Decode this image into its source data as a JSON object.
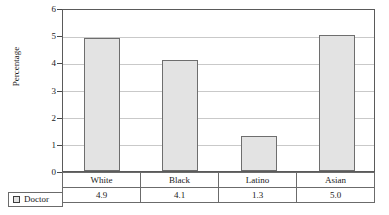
{
  "chart_data": {
    "type": "bar",
    "title": "",
    "subtitle": "",
    "xlabel": "",
    "ylabel": "Percentage",
    "categories": [
      "White",
      "Black",
      "Latino",
      "Asian"
    ],
    "series": [
      {
        "name": "Doctor",
        "values": [
          4.9,
          4.1,
          1.3,
          5.0
        ]
      }
    ],
    "value_labels": [
      "4.9",
      "4.1",
      "1.3",
      "5.0"
    ],
    "ylim": [
      0,
      6
    ],
    "y_ticks": [
      "0",
      "1",
      "2",
      "3",
      "4",
      "5",
      "6"
    ],
    "grid": true,
    "legend_position": "bottom-left",
    "bar_fill_color": "#e3e3e3",
    "bar_border_color": "#6e6e6e",
    "gridline_color": "#c9c9c9",
    "axis_color": "#4a4a4a",
    "annotations": []
  },
  "legend": {
    "series_label": "Doctor",
    "swatch_name": "doctor-series-swatch"
  },
  "table": {
    "row_label": "Doctor",
    "headers": [
      "White",
      "Black",
      "Latino",
      "Asian"
    ],
    "values": [
      "4.9",
      "4.1",
      "1.3",
      "5.0"
    ]
  }
}
